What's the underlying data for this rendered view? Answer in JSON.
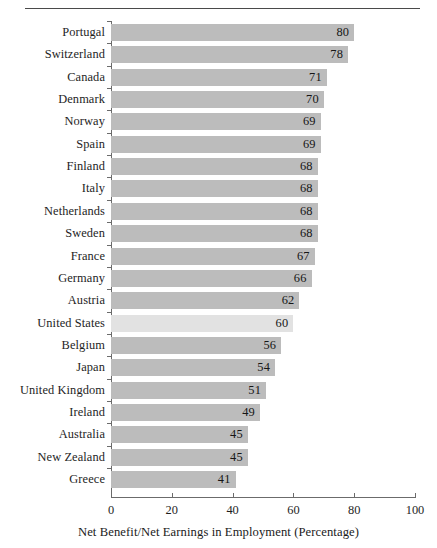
{
  "chart_data": {
    "type": "bar",
    "orientation": "horizontal",
    "title": "",
    "xlabel": "Net Benefit/Net Earnings in Employment (Percentage)",
    "ylabel": "",
    "xlim": [
      0,
      100
    ],
    "xticks": [
      0,
      20,
      40,
      60,
      80,
      100
    ],
    "grid": false,
    "legend": null,
    "highlight_category": "United States",
    "categories": [
      "Portugal",
      "Switzerland",
      "Canada",
      "Denmark",
      "Norway",
      "Spain",
      "Finland",
      "Italy",
      "Netherlands",
      "Sweden",
      "France",
      "Germany",
      "Austria",
      "United States",
      "Belgium",
      "Japan",
      "United Kingdom",
      "Ireland",
      "Australia",
      "New Zealand",
      "Greece"
    ],
    "values": [
      80,
      78,
      71,
      70,
      69,
      69,
      68,
      68,
      68,
      68,
      67,
      66,
      62,
      60,
      56,
      54,
      51,
      49,
      45,
      45,
      41
    ]
  },
  "style": {
    "bar_color": "#bcbcbc",
    "highlight_bar_color": "#e2e2e2",
    "axis_color": "#6b6b6b",
    "rule_color": "#4a4a4a",
    "text_color": "#1a1a1a"
  },
  "axis": {
    "tick_labels": [
      "0",
      "20",
      "40",
      "60",
      "80",
      "100"
    ]
  },
  "caption": {
    "xlabel": "Net Benefit/Net Earnings in Employment (Percentage)"
  }
}
